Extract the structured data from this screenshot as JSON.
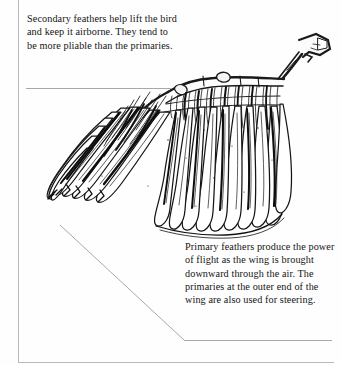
{
  "page": {
    "background_color": "#ffffff",
    "ink_color": "#141414",
    "rule_color": "#a8a8a8",
    "frame_color": "#b9b9b9"
  },
  "illustration": {
    "name": "bird-wing-pen-and-ink-drawing",
    "subject": "bird wing",
    "style": "pen-and-ink hatched line drawing",
    "parts": [
      "primary feathers",
      "secondary feathers",
      "wrist joint",
      "alula"
    ]
  },
  "captions": {
    "secondary": {
      "text": "Secondary feathers help lift the bird and keep it airborne. They tend to be more pliable than the primaries.",
      "lines": [
        "Secondary feathers help",
        "lift the bird and keep it",
        "airborne. They tend to",
        "be more pliable than",
        "the primaries."
      ]
    },
    "primary": {
      "text": "Primary feathers produce the power of flight as the wing is brought downward through the air. The primaries at the outer end of the wing are also used for steering.",
      "lines": [
        "Primary feathers produce",
        "the power of flight as the",
        "wing is brought",
        "downward through the",
        "air. The primaries at the",
        "outer end of the wing are",
        "also used for steering."
      ]
    }
  }
}
